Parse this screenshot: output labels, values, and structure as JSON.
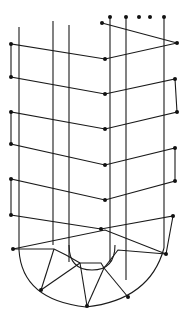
{
  "diagram": {
    "width": 189,
    "height": 317,
    "stroke": "#1a1a1a",
    "background": "#ffffff",
    "verticals": [
      {
        "x": 19,
        "y1": 27,
        "y2": 250
      },
      {
        "x": 53,
        "y1": 21,
        "y2": 245
      },
      {
        "x": 69,
        "y1": 25,
        "y2": 262
      },
      {
        "x": 110,
        "y1": 17,
        "y2": 262
      },
      {
        "x": 126,
        "y1": 17,
        "y2": 280
      },
      {
        "x": 164,
        "y1": 17,
        "y2": 248
      }
    ],
    "zigzag": [
      [
        102,
        23
      ],
      [
        177,
        43
      ],
      [
        105,
        59
      ],
      [
        11,
        44
      ],
      [
        11,
        77
      ],
      [
        105,
        94
      ],
      [
        175,
        79
      ],
      [
        177,
        112
      ],
      [
        105,
        129
      ],
      [
        11,
        112
      ],
      [
        11,
        144
      ],
      [
        105,
        165
      ],
      [
        175,
        148
      ],
      [
        175,
        181
      ],
      [
        105,
        200
      ],
      [
        11,
        179
      ],
      [
        11,
        215
      ],
      [
        101,
        229
      ],
      [
        173,
        216
      ],
      [
        166,
        254
      ],
      [
        105,
        230
      ],
      [
        13,
        249
      ]
    ],
    "inner_u": "M69 245 Q69 270 92 270 Q115 270 115 245",
    "outer_u": "M19 250 Q22 300 86 307 Q150 300 164 248",
    "bottom_links": [
      [
        [
          13,
          249
        ],
        [
          54,
          249
        ],
        [
          66,
          255
        ],
        [
          80,
          263
        ]
      ],
      [
        [
          80,
          263
        ],
        [
          101,
          263
        ],
        [
          104,
          268
        ]
      ],
      [
        [
          104,
          268
        ],
        [
          118,
          250
        ],
        [
          166,
          254
        ]
      ],
      [
        [
          54,
          249
        ],
        [
          41,
          290
        ]
      ],
      [
        [
          80,
          263
        ],
        [
          41,
          290
        ]
      ],
      [
        [
          80,
          263
        ],
        [
          87,
          306
        ]
      ],
      [
        [
          104,
          268
        ],
        [
          87,
          306
        ]
      ],
      [
        [
          104,
          268
        ],
        [
          128,
          297
        ]
      ]
    ],
    "nodes": [
      [
        110,
        17
      ],
      [
        126,
        17
      ],
      [
        139,
        17
      ],
      [
        150,
        17
      ],
      [
        164,
        17
      ],
      [
        102,
        23
      ],
      [
        177,
        43
      ],
      [
        105,
        59
      ],
      [
        11,
        44
      ],
      [
        11,
        77
      ],
      [
        105,
        94
      ],
      [
        175,
        79
      ],
      [
        177,
        112
      ],
      [
        105,
        129
      ],
      [
        11,
        112
      ],
      [
        11,
        144
      ],
      [
        105,
        165
      ],
      [
        175,
        148
      ],
      [
        175,
        181
      ],
      [
        105,
        200
      ],
      [
        11,
        179
      ],
      [
        11,
        215
      ],
      [
        101,
        229
      ],
      [
        173,
        216
      ],
      [
        166,
        254
      ],
      [
        13,
        249
      ],
      [
        41,
        290
      ],
      [
        87,
        306
      ],
      [
        128,
        297
      ]
    ]
  }
}
